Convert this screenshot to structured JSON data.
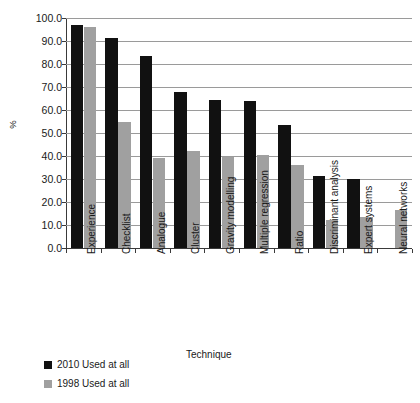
{
  "chart_data": {
    "type": "bar",
    "title": "",
    "xlabel": "Technique",
    "ylabel": "%",
    "ylim": [
      0,
      100
    ],
    "ytick_labels": [
      "100.0",
      "90.0",
      "80.0",
      "70.0",
      "60.0",
      "50.0",
      "40.0",
      "30.0",
      "20.0",
      "10.0",
      "0.0"
    ],
    "ytick_values": [
      100,
      90,
      80,
      70,
      60,
      50,
      40,
      30,
      20,
      10,
      0
    ],
    "grid": true,
    "legend_position": "bottom-left",
    "categories": [
      "Experience",
      "Checklist",
      "Analogue",
      "Cluster",
      "Gravity modelling",
      "Multiple regression",
      "Ratio",
      "Discriminant analysis",
      "Expert systems",
      "Neural networks"
    ],
    "series": [
      {
        "name": "2010 Used at all",
        "color": "#111111",
        "values": [
          97.0,
          91.5,
          83.5,
          68.0,
          64.5,
          64.0,
          53.5,
          31.5,
          30.0,
          0.0
        ]
      },
      {
        "name": "1998 Used at all",
        "color": "#a0a0a0",
        "values": [
          96.0,
          55.0,
          39.0,
          42.0,
          39.5,
          40.5,
          36.0,
          12.3,
          13.3,
          16.7
        ]
      }
    ]
  },
  "legend": {
    "entries": [
      {
        "label": "2010 Used at all",
        "swatch": "black-square-swatch"
      },
      {
        "label": "1998 Used at all",
        "swatch": "gray-square-swatch"
      }
    ]
  },
  "title_remnant": ""
}
